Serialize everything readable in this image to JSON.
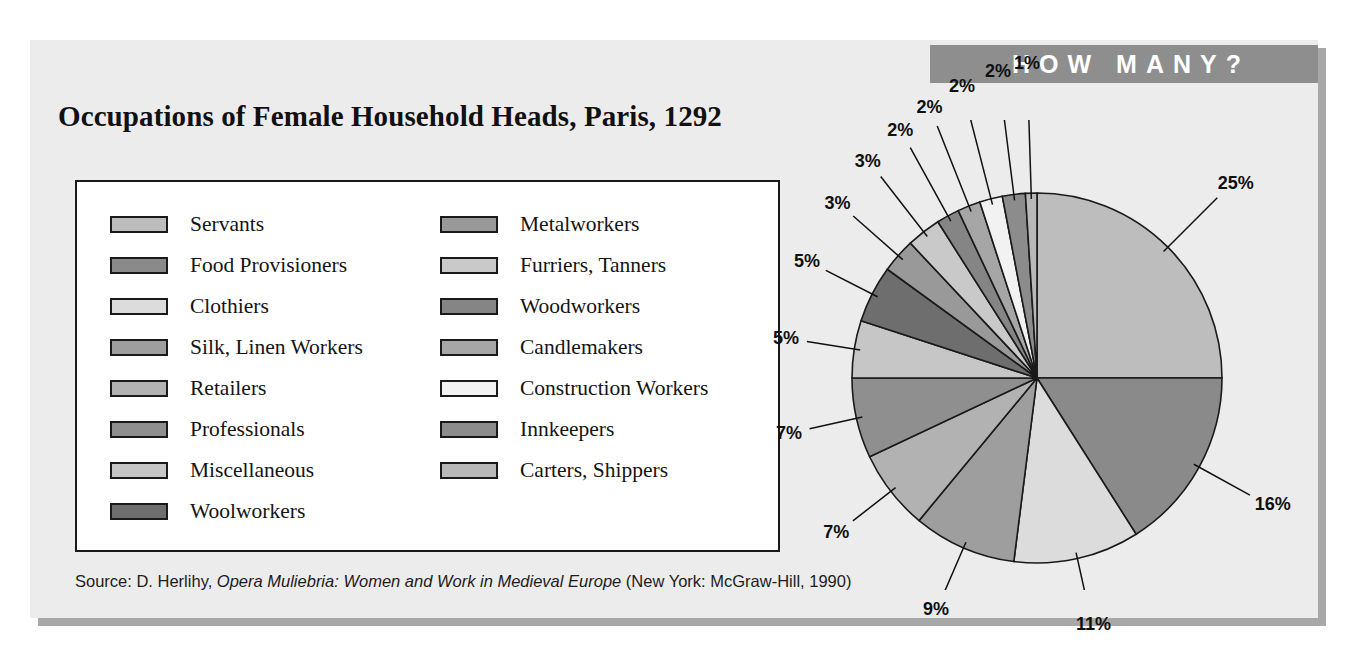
{
  "banner": {
    "label": "HOW MANY?"
  },
  "title": "Occupations of Female Household Heads, Paris, 1292",
  "source": {
    "prefix": "Source: D. Herlihy, ",
    "italic": "Opera Muliebria: Women and Work in Medieval Europe",
    "suffix": " (New York: McGraw-Hill, 1990)"
  },
  "legend": {
    "left": [
      {
        "label": "Servants",
        "color": "#bdbdbd"
      },
      {
        "label": "Food Provisioners",
        "color": "#8a8a8a"
      },
      {
        "label": "Clothiers",
        "color": "#dcdcdc"
      },
      {
        "label": "Silk, Linen Workers",
        "color": "#9e9e9e"
      },
      {
        "label": "Retailers",
        "color": "#b2b2b2"
      },
      {
        "label": "Professionals",
        "color": "#8f8f8f"
      },
      {
        "label": "Miscellaneous",
        "color": "#c6c6c6"
      },
      {
        "label": "Woolworkers",
        "color": "#6e6e6e"
      }
    ],
    "right": [
      {
        "label": "Metalworkers",
        "color": "#999999"
      },
      {
        "label": "Furriers, Tanners",
        "color": "#c9c9c9"
      },
      {
        "label": "Woodworkers",
        "color": "#858585"
      },
      {
        "label": "Candlemakers",
        "color": "#a6a6a6"
      },
      {
        "label": "Construction Workers",
        "color": "#f2f2f2"
      },
      {
        "label": "Innkeepers",
        "color": "#8c8c8c"
      },
      {
        "label": "Carters, Shippers",
        "color": "#b8b8b8"
      }
    ]
  },
  "chart_data": {
    "type": "pie",
    "title": "Occupations of Female Household Heads, Paris, 1292",
    "legend_position": "left",
    "grid": false,
    "categories": [
      "Servants",
      "Food Provisioners",
      "Clothiers",
      "Silk, Linen Workers",
      "Retailers",
      "Professionals",
      "Miscellaneous",
      "Woolworkers",
      "Metalworkers",
      "Furriers, Tanners",
      "Woodworkers",
      "Candlemakers",
      "Construction Workers",
      "Innkeepers",
      "Carters, Shippers"
    ],
    "values": [
      25,
      16,
      11,
      9,
      7,
      7,
      5,
      5,
      3,
      3,
      2,
      2,
      2,
      2,
      1
    ],
    "value_labels": [
      "25%",
      "16%",
      "11%",
      "9%",
      "7%",
      "7%",
      "5%",
      "5%",
      "3%",
      "3%",
      "2%",
      "2%",
      "2%",
      "2%",
      "1%"
    ],
    "colors": [
      "#bdbdbd",
      "#8a8a8a",
      "#dcdcdc",
      "#9e9e9e",
      "#b2b2b2",
      "#8f8f8f",
      "#c6c6c6",
      "#6e6e6e",
      "#999999",
      "#c9c9c9",
      "#858585",
      "#a6a6a6",
      "#f2f2f2",
      "#8c8c8c",
      "#b8b8b8"
    ],
    "start_angle_deg": 0,
    "direction": "clockwise",
    "units": "percent"
  }
}
